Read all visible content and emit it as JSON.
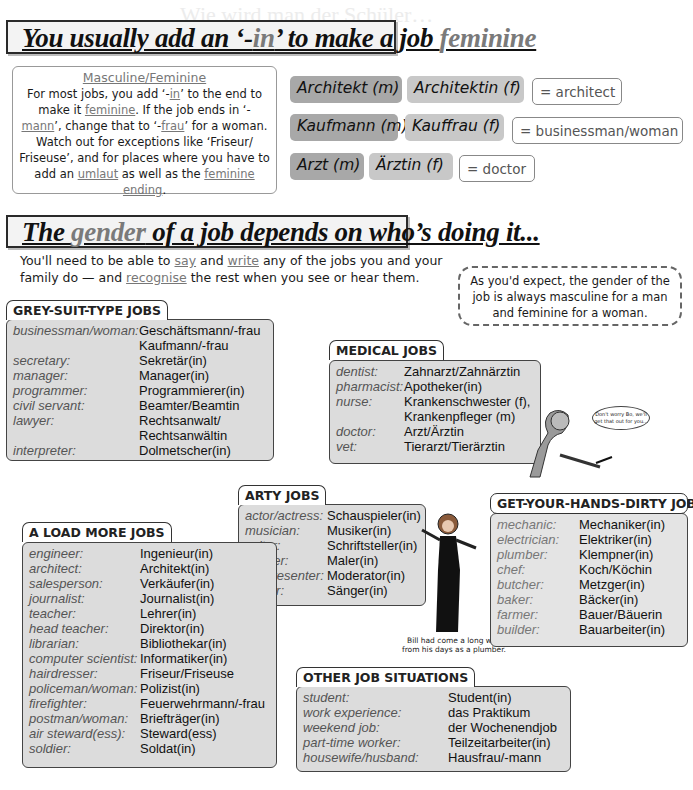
{
  "background_heading": "Wie wird man der Schüler…",
  "section1": {
    "title_parts": [
      "You usually add an ‘-",
      "in",
      "’ to make a job ",
      "feminine"
    ],
    "infobox": {
      "title": "Masculine/Feminine",
      "text": [
        "For most jobs, you add ‘-",
        "in",
        "’ to the end to make it ",
        "feminine",
        ".  If the job ends in ‘-",
        "mann",
        "’, change that to ‘-",
        "frau",
        "’ for a woman. Watch out for exceptions like ‘Friseur/ Friseuse’, and for places where you have to add an ",
        "umlaut",
        " as well as the ",
        "feminine ending",
        "."
      ]
    },
    "examples": [
      {
        "masculine": "Architekt (m)",
        "feminine": "Architektin (f)",
        "translation": "= architect"
      },
      {
        "masculine": "Kaufmann (m)",
        "feminine": "Kauffrau (f)",
        "translation": "= businessman/woman"
      },
      {
        "masculine": "Arzt (m)",
        "feminine": "Ärztin (f)",
        "translation": "= doctor"
      }
    ]
  },
  "section2": {
    "title_parts": [
      "The ",
      "gender",
      " of a job depends on who’s doing it..."
    ],
    "intro_parts": [
      "You'll need to be able to ",
      "say",
      " and ",
      "write",
      " any of the jobs you and your family do — and ",
      "recognise",
      " the rest when you see or hear them."
    ],
    "callout": "As you'd expect, the gender of the job is always masculine for a man and feminine for a woman."
  },
  "groups": {
    "grey_suit": {
      "title": "GREY-SUIT-TYPE JOBS",
      "rows": [
        [
          "businessman/woman:",
          "Geschäftsmann/-frau"
        ],
        [
          "",
          "Kaufmann/-frau"
        ],
        [
          "secretary:",
          "Sekretär(in)"
        ],
        [
          "manager:",
          "Manager(in)"
        ],
        [
          "programmer:",
          "Programmierer(in)"
        ],
        [
          "civil servant:",
          "Beamter/Beamtin"
        ],
        [
          "lawyer:",
          "Rechtsanwalt/"
        ],
        [
          "",
          "Rechtsanwältin"
        ],
        [
          "interpreter:",
          "Dolmetscher(in)"
        ]
      ]
    },
    "medical": {
      "title": "MEDICAL JOBS",
      "rows": [
        [
          "dentist:",
          "Zahnarzt/Zahnärztin"
        ],
        [
          "pharmacist:",
          "Apotheker(in)"
        ],
        [
          "nurse:",
          "Krankenschwester (f),"
        ],
        [
          "",
          "Krankenpfleger (m)"
        ],
        [
          "doctor:",
          "Arzt/Ärztin"
        ],
        [
          "vet:",
          "Tierarzt/Tierärztin"
        ]
      ]
    },
    "arty": {
      "title": "ARTY JOBS",
      "rows": [
        [
          "actor/actress:",
          "Schauspieler(in)"
        ],
        [
          "musician:",
          "Musiker(in)"
        ],
        [
          "writer:",
          "Schriftsteller(in)"
        ],
        [
          "painter:",
          "Maler(in)"
        ],
        [
          "TV presenter:",
          "Moderator(in)"
        ],
        [
          "singer:",
          "Sänger(in)"
        ]
      ]
    },
    "hands_dirty": {
      "title": "GET-YOUR-HANDS-DIRTY JOBS",
      "rows": [
        [
          "mechanic:",
          "Mechaniker(in)"
        ],
        [
          "electrician:",
          "Elektriker(in)"
        ],
        [
          "plumber:",
          "Klempner(in)"
        ],
        [
          "chef:",
          "Koch/Köchin"
        ],
        [
          "butcher:",
          "Metzger(in)"
        ],
        [
          "baker:",
          "Bäcker(in)"
        ],
        [
          "farmer:",
          "Bauer/Bäuerin"
        ],
        [
          "builder:",
          "Bauarbeiter(in)"
        ]
      ]
    },
    "load_more": {
      "title": "A LOAD MORE JOBS",
      "rows": [
        [
          "engineer:",
          "Ingenieur(in)"
        ],
        [
          "architect:",
          "Architekt(in)"
        ],
        [
          "salesperson:",
          "Verkäufer(in)"
        ],
        [
          "journalist:",
          "Journalist(in)"
        ],
        [
          "teacher:",
          "Lehrer(in)"
        ],
        [
          "head teacher:",
          "Direktor(in)"
        ],
        [
          "librarian:",
          "Bibliothekar(in)"
        ],
        [
          "computer scientist:",
          "Informatiker(in)"
        ],
        [
          "hairdresser:",
          "Friseur/Friseuse"
        ],
        [
          "policeman/woman:",
          "Polizist(in)"
        ],
        [
          "firefighter:",
          "Feuerwehrmann/-frau"
        ],
        [
          "postman/woman:",
          "Briefträger(in)"
        ],
        [
          "air steward(ess):",
          "Steward(ess)"
        ],
        [
          "soldier:",
          "Soldat(in)"
        ]
      ]
    },
    "other": {
      "title": "OTHER JOB SITUATIONS",
      "rows": [
        [
          "student:",
          "Student(in)"
        ],
        [
          "work experience:",
          "das Praktikum"
        ],
        [
          "weekend job:",
          "der Wochenendjob"
        ],
        [
          "part-time worker:",
          "Teilzeitarbeiter(in)"
        ],
        [
          "housewife/husband:",
          "Hausfrau/-mann"
        ]
      ]
    }
  },
  "illustrations": {
    "nurse_speech": "Don't worry Bo, we'll get that out for you...",
    "singer_caption": "Bill had come a long way from his days as a plumber."
  }
}
